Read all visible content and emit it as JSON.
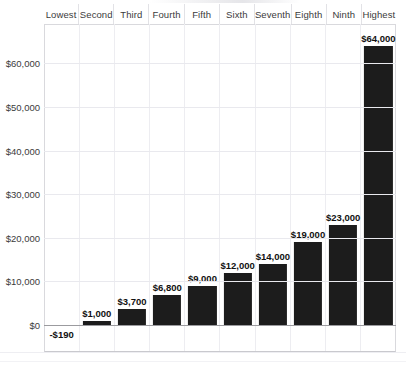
{
  "chart_data": {
    "type": "bar",
    "title": "",
    "xlabel": "",
    "ylabel": "",
    "categories": [
      "Lowest",
      "Second",
      "Third",
      "Fourth",
      "Fifth",
      "Sixth",
      "Seventh",
      "Eighth",
      "Ninth",
      "Highest"
    ],
    "values": [
      -190,
      1000,
      3700,
      6800,
      9000,
      12000,
      14000,
      19000,
      23000,
      64000
    ],
    "data_labels": [
      "-$190",
      "$1,000",
      "$3,700",
      "$6,800",
      "$9,000",
      "$12,000",
      "$14,000",
      "$19,000",
      "$23,000",
      "$64,000"
    ],
    "ylim": [
      -2000,
      66000
    ],
    "yticks": [
      0,
      10000,
      20000,
      30000,
      40000,
      50000,
      60000
    ],
    "ytick_labels": [
      "$0",
      "$10,000",
      "$20,000",
      "$30,000",
      "$40,000",
      "$50,000",
      "$60,000"
    ],
    "grid": true,
    "legend": "none",
    "bar_color": "#1c1c1c",
    "axis_color": "#9b9b9f",
    "gridline_color": "#e9e9ee"
  },
  "axis": {
    "ticks": [
      {
        "label": "$60,000"
      },
      {
        "label": "$50,000"
      },
      {
        "label": "$40,000"
      },
      {
        "label": "$30,000"
      },
      {
        "label": "$20,000"
      },
      {
        "label": "$10,000"
      },
      {
        "label": "$0"
      }
    ]
  },
  "columns": [
    {
      "header": "Lowest",
      "label": "-$190",
      "value": -190
    },
    {
      "header": "Second",
      "label": "$1,000",
      "value": 1000
    },
    {
      "header": "Third",
      "label": "$3,700",
      "value": 3700
    },
    {
      "header": "Fourth",
      "label": "$6,800",
      "value": 6800
    },
    {
      "header": "Fifth",
      "label": "$9,000",
      "value": 9000
    },
    {
      "header": "Sixth",
      "label": "$12,000",
      "value": 12000
    },
    {
      "header": "Seventh",
      "label": "$14,000",
      "value": 14000
    },
    {
      "header": "Eighth",
      "label": "$19,000",
      "value": 19000
    },
    {
      "header": "Ninth",
      "label": "$23,000",
      "value": 23000
    },
    {
      "header": "Highest",
      "label": "$64,000",
      "value": 64000
    }
  ]
}
